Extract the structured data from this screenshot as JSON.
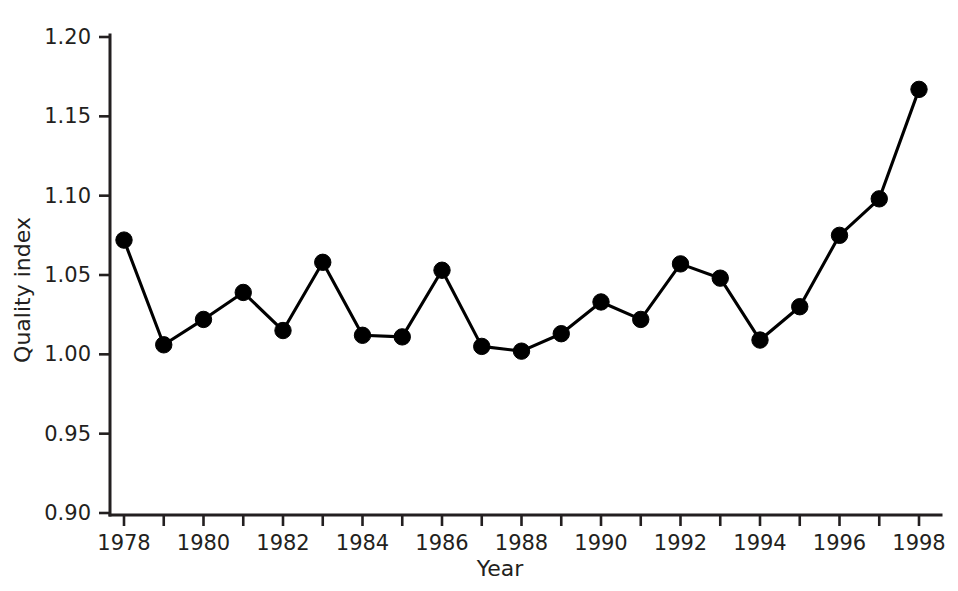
{
  "chart_data": {
    "type": "line",
    "title": "",
    "xlabel": "Year",
    "ylabel": "Quality index",
    "x": [
      1978,
      1979,
      1980,
      1981,
      1982,
      1983,
      1984,
      1985,
      1986,
      1987,
      1988,
      1989,
      1990,
      1991,
      1992,
      1993,
      1994,
      1995,
      1996,
      1997,
      1998
    ],
    "values": [
      1.072,
      1.006,
      1.022,
      1.039,
      1.015,
      1.058,
      1.012,
      1.011,
      1.053,
      1.005,
      1.002,
      1.013,
      1.033,
      1.022,
      1.057,
      1.048,
      1.009,
      1.03,
      1.075,
      1.098,
      1.167
    ],
    "series": [
      {
        "name": "Quality index",
        "values": [
          1.072,
          1.006,
          1.022,
          1.039,
          1.015,
          1.058,
          1.012,
          1.011,
          1.053,
          1.005,
          1.002,
          1.013,
          1.033,
          1.022,
          1.057,
          1.048,
          1.009,
          1.03,
          1.075,
          1.098,
          1.167
        ]
      }
    ],
    "xlim": [
      1978,
      1998
    ],
    "ylim": [
      0.9,
      1.2
    ],
    "ytick_labels": [
      "1.20",
      "1.15",
      "1.10",
      "1.05",
      "1.00",
      "0.95",
      "0.90"
    ],
    "ytick_values": [
      1.2,
      1.15,
      1.1,
      1.05,
      1.0,
      0.95,
      0.9
    ],
    "xtick_values": [
      1978,
      1979,
      1980,
      1981,
      1982,
      1983,
      1984,
      1985,
      1986,
      1987,
      1988,
      1989,
      1990,
      1991,
      1992,
      1993,
      1994,
      1995,
      1996,
      1997,
      1998
    ],
    "xtick_labels": [
      "1978",
      "",
      "1980",
      "",
      "1982",
      "",
      "1984",
      "",
      "1986",
      "",
      "1988",
      "",
      "1990",
      "",
      "1992",
      "",
      "1994",
      "",
      "1996",
      "",
      "1998"
    ],
    "grid": false,
    "legend": false,
    "legend_position": "none",
    "marker": "filled-circle",
    "line_color": "#000000",
    "marker_color": "#000000",
    "axis_color": "#231f20",
    "background_color": "#ffffff"
  }
}
